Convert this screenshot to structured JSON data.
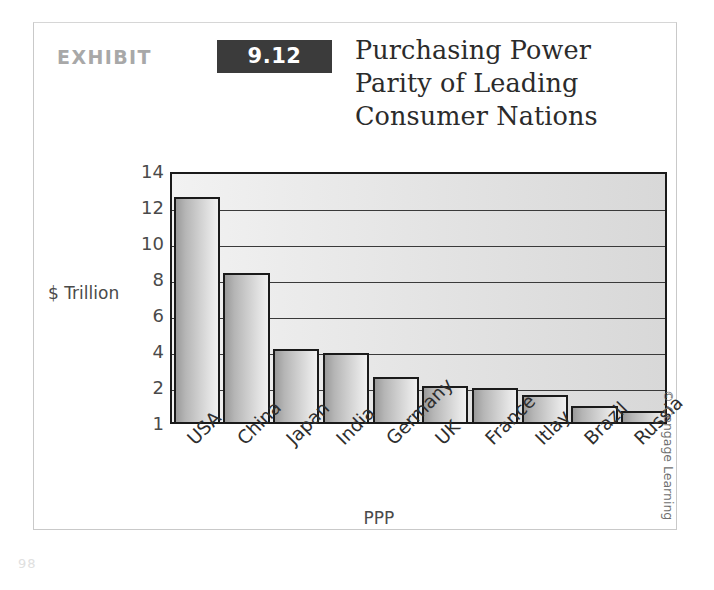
{
  "exhibit": {
    "label": "EXHIBIT",
    "number": "9.12",
    "title_lines": [
      "Purchasing Power",
      "Parity of Leading",
      "Consumer Nations"
    ],
    "title_full": "Purchasing Power Parity of Leading Consumer Nations"
  },
  "credit": "© Cengage Learning",
  "page_artifact": "98",
  "colors": {
    "badge_bg": "#3b3b3b",
    "badge_text": "#ffffff",
    "exhibit_word": "#a8a8a8",
    "title_text": "#2b2b2b",
    "axis_line": "#1a1a1a",
    "gridline": "#3a3a3a",
    "plot_bg_light": "#f2f2f2",
    "plot_bg_dark": "#d8d8d8",
    "bar_gradient_dark": "#9a9a9a",
    "bar_gradient_light": "#f0f0f0",
    "tick_text": "#4a4a4a",
    "frame_border": "#c9c9c9"
  },
  "chart_data": {
    "type": "bar",
    "title": "Purchasing Power Parity of Leading Consumer Nations",
    "xlabel": "PPP",
    "ylabel": "$ Trillion",
    "categories": [
      "USA",
      "China",
      "Japan",
      "India",
      "Germany",
      "UK",
      "France",
      "Itlay",
      "Brazil",
      "Russia"
    ],
    "values": [
      12.5,
      8.3,
      4.05,
      3.85,
      2.5,
      2.0,
      1.95,
      1.75,
      1.45,
      1.3
    ],
    "ylim": [
      1,
      14
    ],
    "yticks": [
      14,
      12,
      10,
      8,
      6,
      4,
      2,
      1
    ],
    "ytick_labels": [
      "14",
      "12",
      "10",
      "8",
      "6",
      "4",
      "2",
      "1"
    ],
    "grid": true,
    "grid_axis": "y",
    "legend": false,
    "legend_position": "none",
    "orientation": "vertical",
    "series": [
      {
        "name": "PPP ($ Trillion)",
        "values": [
          12.5,
          8.3,
          4.05,
          3.85,
          2.5,
          2.0,
          1.95,
          1.75,
          1.45,
          1.3
        ]
      }
    ]
  }
}
